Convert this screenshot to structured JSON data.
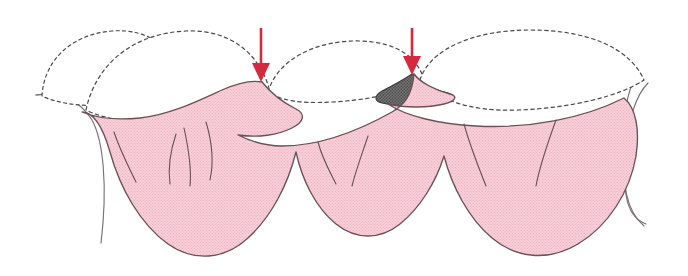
{
  "figure": {
    "title": "Interdental black triangle defects at gingival papillae",
    "caption": "",
    "width": 688,
    "height": 276,
    "background_color": "#ffffff"
  },
  "colors": {
    "gingiva_fill": "#f6ccd6",
    "gingiva_halftone_dot": "#f0b4c4",
    "gingiva_outline": "#6b5057",
    "tooth_fill": "#ffffff",
    "tooth_outline_dashed": "#4a4a4a",
    "defect_fill": "#6e6e6e",
    "defect_halftone_dot": "#4f4f4f",
    "defect_outline": "#3d3d3d",
    "arrow_red": "#d32a3f",
    "detail_line": "#6b5057",
    "edge_line": "#7a7076"
  },
  "annotations": {
    "arrows": [
      {
        "name": "arrow-left",
        "label": "red-down-arrow-1",
        "color": "#d32a3f",
        "x": 261,
        "y_start": 28,
        "y_end": 82,
        "direction": "down",
        "points_at": "interdental-defect-left"
      },
      {
        "name": "arrow-right",
        "label": "red-down-arrow-2",
        "color": "#d32a3f",
        "x": 412,
        "y_start": 28,
        "y_end": 75,
        "direction": "down",
        "points_at": "interdental-defect-right"
      }
    ],
    "defects": [
      {
        "name": "interdental-defect-left",
        "label": "black-triangle-space-left",
        "fill": "#6e6e6e",
        "center_x": 262,
        "center_y": 100
      },
      {
        "name": "interdental-defect-right",
        "label": "black-triangle-space-right",
        "fill": "#6e6e6e",
        "center_x": 414,
        "center_y": 88
      }
    ]
  },
  "anatomy": {
    "teeth": [
      {
        "name": "tooth-crown-1",
        "label": "tooth-1",
        "outline": "dashed"
      },
      {
        "name": "tooth-crown-2",
        "label": "tooth-2",
        "outline": "dashed"
      },
      {
        "name": "tooth-crown-3",
        "label": "tooth-3",
        "outline": "dashed"
      },
      {
        "name": "tooth-crown-4",
        "label": "tooth-4",
        "outline": "dashed"
      }
    ],
    "papillae": [
      {
        "name": "gingival-papilla-1",
        "label": "papilla-1"
      },
      {
        "name": "gingival-papilla-2",
        "label": "papilla-2"
      },
      {
        "name": "gingival-papilla-3",
        "label": "papilla-3"
      }
    ],
    "root_eminence_lines": 8,
    "gingiva_name": "gingival-tissue-mass"
  }
}
